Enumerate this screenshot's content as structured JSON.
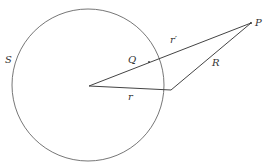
{
  "diagram": {
    "type": "geometry",
    "colors": {
      "stroke": "#555555",
      "text": "#333333",
      "background": "#ffffff"
    },
    "circle": {
      "cx": 88,
      "cy": 85,
      "r": 76,
      "label": "S"
    },
    "points": {
      "center": {
        "x": 89,
        "y": 86
      },
      "surface": {
        "x": 171,
        "y": 90
      },
      "P": {
        "x": 251,
        "y": 23,
        "label": "P"
      },
      "Q": {
        "x": 149,
        "y": 62,
        "label": "Q"
      }
    },
    "labels": {
      "S": "S",
      "P": "P",
      "Q": "Q",
      "r": "r",
      "r_prime": "r′",
      "R": "R"
    }
  }
}
